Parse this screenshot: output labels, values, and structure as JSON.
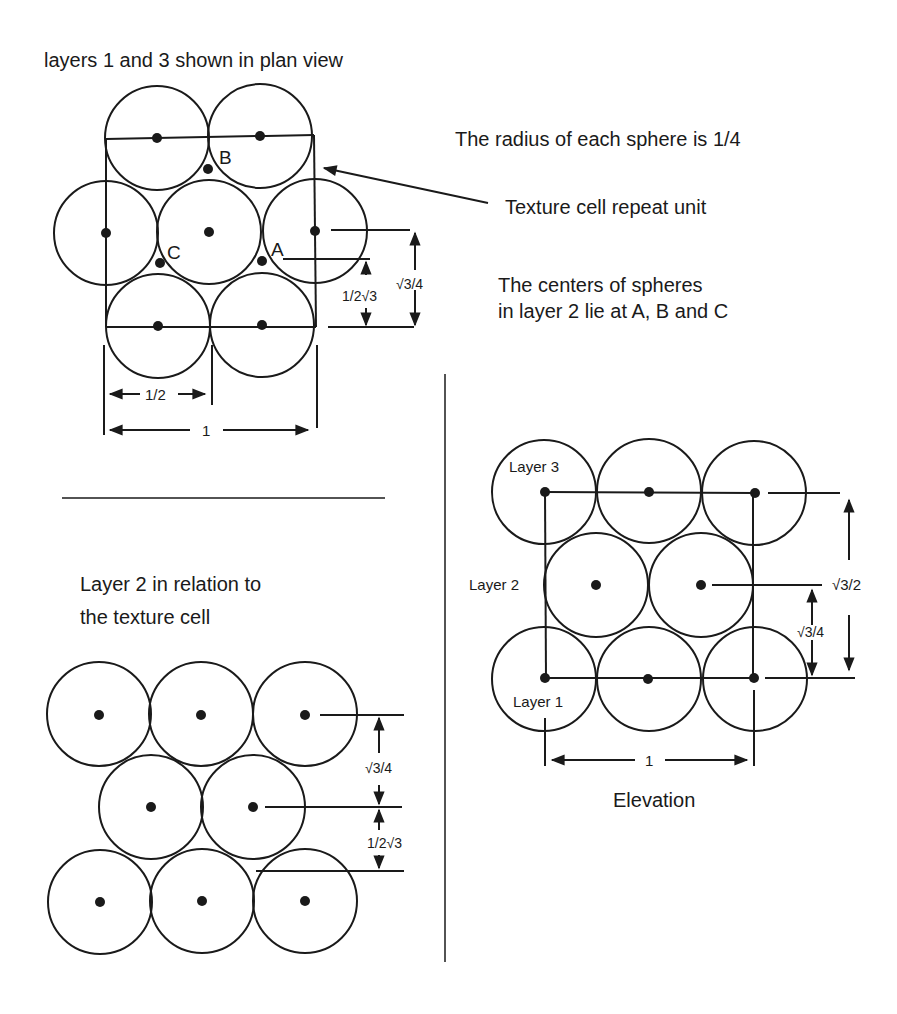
{
  "plan_view": {
    "title": "layers 1 and 3 shown in plan view",
    "labels": {
      "a": "A",
      "b": "B",
      "c": "C"
    },
    "dim_half": "1/2",
    "dim_one": "1",
    "dim_inv": "1/2√3",
    "dim_sqrt3_4": "√3/4"
  },
  "notes": {
    "radius": "The radius of each sphere is  1/4",
    "repeat_unit": "Texture cell repeat unit",
    "centers_line1": "The centers of spheres",
    "centers_line2": "in layer 2 lie at A, B and C"
  },
  "layer2_view": {
    "title_line1": "Layer 2 in relation to",
    "title_line2": "the texture cell",
    "dim_sqrt3_4": "√3/4",
    "dim_inv": "1/2√3"
  },
  "elevation": {
    "layer3": "Layer 3",
    "layer2": "Layer 2",
    "layer1": "Layer 1",
    "dim_sqrt3_2": "√3/2",
    "dim_sqrt3_4": "√3/4",
    "dim_one": "1",
    "caption": "Elevation"
  }
}
